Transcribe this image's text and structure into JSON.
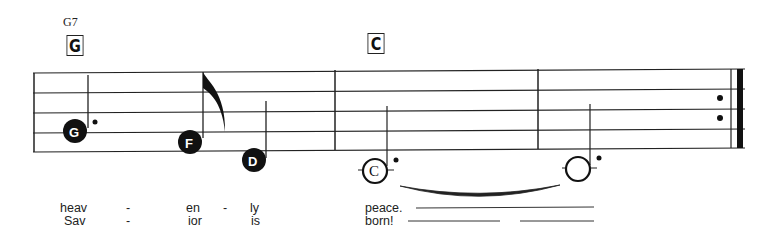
{
  "score": {
    "chords": [
      {
        "small_label": "G7",
        "box_label": "G"
      },
      {
        "box_label": "C"
      }
    ],
    "notes": [
      {
        "name": "G",
        "style": "filled",
        "duration": "dotted-quarter"
      },
      {
        "name": "F",
        "style": "filled",
        "duration": "eighth"
      },
      {
        "name": "D",
        "style": "filled",
        "duration": "quarter"
      },
      {
        "name": "C",
        "style": "open",
        "duration": "dotted-half"
      },
      {
        "name": "",
        "style": "open",
        "duration": "dotted-half",
        "tied": true
      }
    ],
    "end": "repeat-end-barline",
    "lyrics": {
      "verse1": [
        "heav",
        "-",
        "en",
        "-",
        "ly",
        "peace."
      ],
      "verse2": [
        "Sav",
        "-",
        "ior",
        "is",
        "born!"
      ]
    }
  }
}
